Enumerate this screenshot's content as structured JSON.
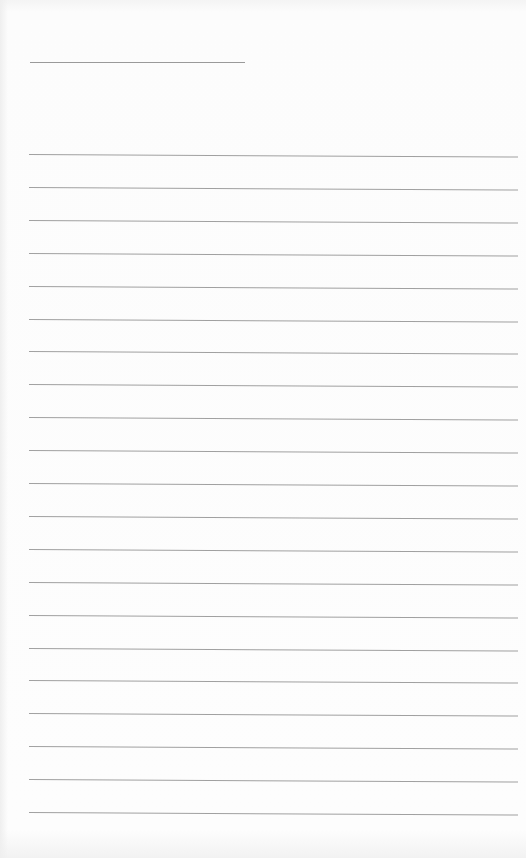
{
  "page": {
    "type": "lined-paper",
    "background_color": "#fbfbfb",
    "line_color": "#a0a0a0",
    "title_line": {
      "x": 30,
      "y": 62,
      "width": 215
    },
    "ruled_lines": {
      "count": 21,
      "start_y": 154,
      "spacing": 32.9,
      "x": 29,
      "width": 489
    }
  }
}
